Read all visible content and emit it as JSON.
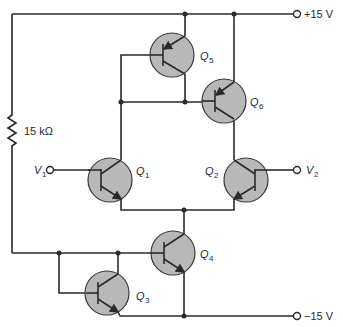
{
  "diagram": {
    "type": "circuit-schematic",
    "supply_positive": "+15 V",
    "supply_negative": "−15 V",
    "resistor": {
      "label": "15 kΩ"
    },
    "inputs": [
      {
        "name": "V",
        "sub": "1"
      },
      {
        "name": "V",
        "sub": "2"
      }
    ],
    "transistors": [
      {
        "id": "Q1",
        "name": "Q",
        "sub": "1",
        "type": "npn"
      },
      {
        "id": "Q2",
        "name": "Q",
        "sub": "2",
        "type": "npn"
      },
      {
        "id": "Q3",
        "name": "Q",
        "sub": "3",
        "type": "npn"
      },
      {
        "id": "Q4",
        "name": "Q",
        "sub": "4",
        "type": "npn"
      },
      {
        "id": "Q5",
        "name": "Q",
        "sub": "5",
        "type": "pnp"
      },
      {
        "id": "Q6",
        "name": "Q",
        "sub": "6",
        "type": "pnp"
      }
    ]
  }
}
